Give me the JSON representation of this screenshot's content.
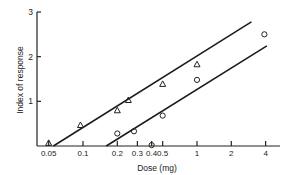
{
  "chart_data": {
    "type": "scatter",
    "title": "",
    "xlabel": "Dose (mg)",
    "ylabel": "Index of response",
    "xscale": "log",
    "x_ticks": [
      0.05,
      0.1,
      0.2,
      0.3,
      0.4,
      0.5,
      1,
      2,
      4
    ],
    "x_tick_labels": [
      "0.05",
      "0.1",
      "0.2",
      "0.3",
      "0.4",
      "0.5",
      "1",
      "2",
      "4"
    ],
    "y_ticks": [
      1,
      2,
      3
    ],
    "y_tick_labels": [
      "1",
      "2",
      "3"
    ],
    "ylim": [
      0,
      3
    ],
    "xlim": [
      0.04,
      4.5
    ],
    "grid": false,
    "legend": "none",
    "series": [
      {
        "name": "triangles",
        "marker": "triangle",
        "points": [
          {
            "x": 0.05,
            "y": 0.07
          },
          {
            "x": 0.095,
            "y": 0.47
          },
          {
            "x": 0.2,
            "y": 0.8
          },
          {
            "x": 0.25,
            "y": 1.03
          },
          {
            "x": 0.5,
            "y": 1.39
          },
          {
            "x": 1.0,
            "y": 1.83
          }
        ],
        "fit_line": {
          "x_start": 0.055,
          "y_start": 0.0,
          "x_end": 3.0,
          "y_end": 2.78
        }
      },
      {
        "name": "circles",
        "marker": "circle",
        "points": [
          {
            "x": 0.2,
            "y": 0.28
          },
          {
            "x": 0.28,
            "y": 0.33
          },
          {
            "x": 0.4,
            "y": 0.02
          },
          {
            "x": 0.5,
            "y": 0.68
          },
          {
            "x": 1.0,
            "y": 1.48
          },
          {
            "x": 3.9,
            "y": 2.5
          }
        ],
        "fit_line": {
          "x_start": 0.16,
          "y_start": 0.0,
          "x_end": 4.1,
          "y_end": 2.24
        }
      }
    ]
  }
}
